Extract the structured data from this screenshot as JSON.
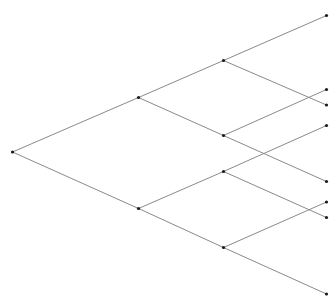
{
  "diagram": {
    "type": "binary-tree",
    "colors": {
      "edge": "#8a8a8a",
      "node": "#1a1a1a",
      "background": "#ffffff"
    },
    "nodes": [
      {
        "id": "root",
        "x": 12.5,
        "y": 152
      },
      {
        "id": "n1a",
        "x": 138.5,
        "y": 97.5
      },
      {
        "id": "n1b",
        "x": 138.5,
        "y": 208.5
      },
      {
        "id": "n2a",
        "x": 223.5,
        "y": 60.5
      },
      {
        "id": "n2b",
        "x": 223.5,
        "y": 135.5
      },
      {
        "id": "n2c",
        "x": 223.5,
        "y": 171.5
      },
      {
        "id": "n2d",
        "x": 223.5,
        "y": 247.5
      },
      {
        "id": "l1",
        "x": 326.5,
        "y": 15.5
      },
      {
        "id": "l2",
        "x": 326.5,
        "y": 89.5
      },
      {
        "id": "l3",
        "x": 326.5,
        "y": 105
      },
      {
        "id": "l4",
        "x": 326.5,
        "y": 125.5
      },
      {
        "id": "l5",
        "x": 326.5,
        "y": 181.5
      },
      {
        "id": "l6",
        "x": 326.5,
        "y": 202
      },
      {
        "id": "l7",
        "x": 326.5,
        "y": 217.5
      },
      {
        "id": "l8",
        "x": 326.5,
        "y": 294
      }
    ],
    "edges": [
      [
        "root",
        "n1a"
      ],
      [
        "root",
        "n1b"
      ],
      [
        "n1a",
        "n2a"
      ],
      [
        "n1a",
        "n2b"
      ],
      [
        "n1b",
        "n2c"
      ],
      [
        "n1b",
        "n2d"
      ],
      [
        "n2a",
        "l1"
      ],
      [
        "n2a",
        "l3"
      ],
      [
        "n2b",
        "l2"
      ],
      [
        "n2b",
        "l5"
      ],
      [
        "n2c",
        "l4"
      ],
      [
        "n2c",
        "l7"
      ],
      [
        "n2d",
        "l6"
      ],
      [
        "n2d",
        "l8"
      ]
    ]
  }
}
